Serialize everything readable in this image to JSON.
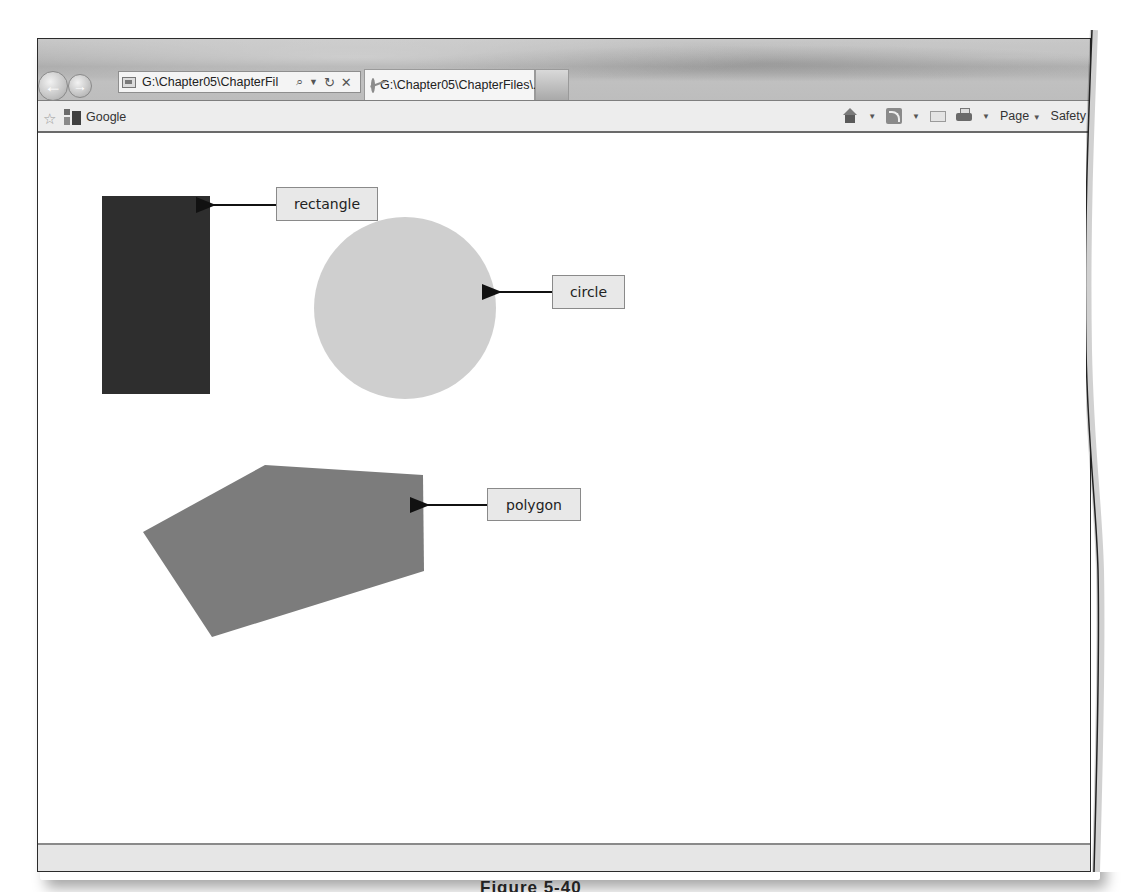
{
  "browser": {
    "address_bar": {
      "url_text": "G:\\Chapter05\\ChapterFil",
      "search_icon": "magnifier-icon",
      "dropdown_icon": "chevron-down-icon",
      "refresh_icon": "refresh-icon",
      "stop_icon": "close-icon"
    },
    "tabs": [
      {
        "title": "G:\\Chapter05\\ChapterFiles\\...",
        "close": "×",
        "active": true
      }
    ],
    "new_tab_icon": "new-tab-icon",
    "nav": {
      "back": "←",
      "forward": "→"
    }
  },
  "favorites_bar": {
    "favorites_icon": "☆",
    "items": [
      {
        "label": "Google"
      }
    ]
  },
  "command_bar": {
    "page_label": "Page",
    "safety_label": "Safety",
    "dropdown_arrow": "▼"
  },
  "canvas": {
    "shapes": [
      {
        "type": "rectangle",
        "label": "rectangle",
        "fill": "#2e2e2e",
        "x": 102,
        "y": 196,
        "width": 108,
        "height": 198
      },
      {
        "type": "circle",
        "label": "circle",
        "fill": "#cfcfcf",
        "cx": 405,
        "cy": 308,
        "r": 91
      },
      {
        "type": "polygon",
        "label": "polygon",
        "fill": "#7c7c7c",
        "points": "143,532 265,465 423,475 424,571 212,637"
      }
    ],
    "callouts": [
      {
        "text": "rectangle",
        "box": {
          "x": 276,
          "y": 187,
          "w": 102,
          "h": 34
        },
        "arrow": {
          "x1": 276,
          "y1": 205,
          "x2": 210,
          "y2": 205
        }
      },
      {
        "text": "circle",
        "box": {
          "x": 552,
          "y": 275,
          "w": 73,
          "h": 34
        },
        "arrow": {
          "x1": 552,
          "y1": 292,
          "x2": 496,
          "y2": 292
        }
      },
      {
        "text": "polygon",
        "box": {
          "x": 487,
          "y": 488,
          "w": 94,
          "h": 33
        },
        "arrow": {
          "x1": 487,
          "y1": 505,
          "x2": 424,
          "y2": 505
        }
      }
    ]
  },
  "colors": {
    "rectangle": "#2e2e2e",
    "circle": "#cfcfcf",
    "polygon": "#7c7c7c",
    "label_bg": "#e8e8e8"
  },
  "caption": "Figure 5-40"
}
